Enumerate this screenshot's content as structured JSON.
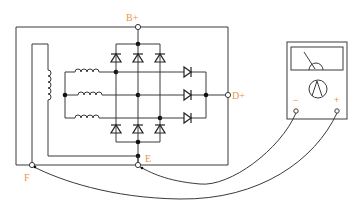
{
  "diagram": {
    "terminals": {
      "b_plus": "B+",
      "d_plus": "D+",
      "e": "E",
      "f": "F"
    },
    "meter": {
      "name": "analog multimeter",
      "minus_label": "−",
      "plus_label": "+"
    },
    "components": {
      "field_winding": "field coil",
      "stator_windings": 3,
      "main_diodes_top": 3,
      "main_diodes_bottom": 3,
      "exciter_diodes": 3
    },
    "colors": {
      "wire": "#3a3a3a",
      "label": "#e8944a",
      "background": "#ffffff"
    }
  }
}
